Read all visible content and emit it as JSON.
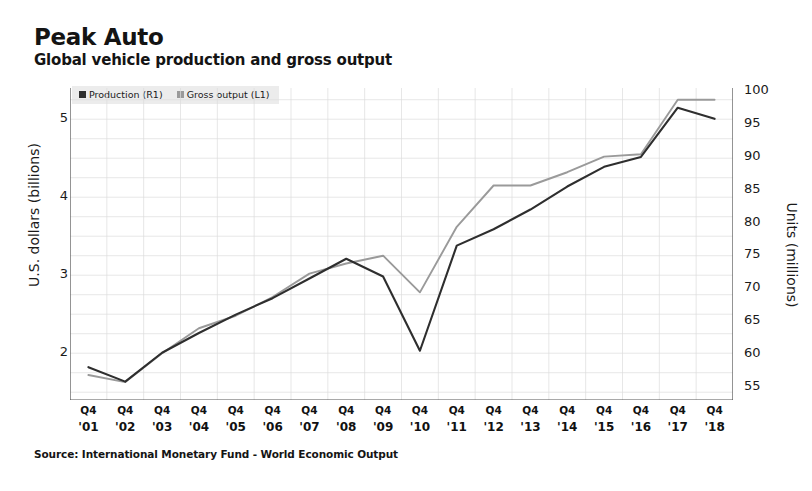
{
  "title": "Peak Auto",
  "subtitle": "Global vehicle production and gross output",
  "source": "Source: International Monetary Fund - World Economic Output",
  "legend": {
    "items": [
      {
        "label": "Production (R1)",
        "color": "#2e2e2e"
      },
      {
        "label": "Gross output (L1)",
        "color": "#9a9a9a"
      }
    ]
  },
  "axes": {
    "left_label": "U.S. dollars (billions)",
    "right_label": "Units (millions)",
    "left_ticks": [
      "2",
      "3",
      "4",
      "5"
    ],
    "right_ticks": [
      "55",
      "60",
      "65",
      "70",
      "75",
      "80",
      "85",
      "90",
      "95",
      "100"
    ],
    "quarter_label": "Q4"
  },
  "chart_data": {
    "type": "line",
    "title": "Peak Auto",
    "subtitle": "Global vehicle production and gross output",
    "xlabel": "",
    "ylabel": "U.S. dollars (billions)",
    "y2label": "Units (millions)",
    "grid": true,
    "legend_position": "top-left",
    "x": [
      "'01",
      "'02",
      "'03",
      "'04",
      "'05",
      "'06",
      "'07",
      "'08",
      "'09",
      "'10",
      "'11",
      "'12",
      "'13",
      "'14",
      "'15",
      "'16",
      "'17",
      "'18"
    ],
    "x_quarter": "Q4",
    "ylim": [
      1.4,
      5.4
    ],
    "y2lim": [
      53,
      100.5
    ],
    "yticks": [
      2,
      3,
      4,
      5
    ],
    "y2ticks": [
      55,
      60,
      65,
      70,
      75,
      80,
      85,
      90,
      95,
      100
    ],
    "series": [
      {
        "name": "Production (R1)",
        "axis": "right",
        "color": "#2e2e2e",
        "unit": "millions of units",
        "values": [
          58.0,
          55.8,
          60.2,
          63.2,
          66.0,
          68.5,
          71.5,
          74.5,
          71.8,
          60.5,
          76.5,
          79.0,
          82.0,
          85.5,
          88.5,
          90.0,
          97.5,
          95.8
        ]
      },
      {
        "name": "Gross output (L1)",
        "axis": "left",
        "color": "#9a9a9a",
        "unit": "billions of U.S. dollars",
        "values": [
          1.72,
          1.63,
          2.0,
          2.32,
          2.48,
          2.72,
          3.02,
          3.15,
          3.25,
          2.78,
          3.62,
          4.15,
          4.15,
          4.32,
          4.52,
          4.55,
          5.25,
          5.25
        ]
      }
    ]
  }
}
